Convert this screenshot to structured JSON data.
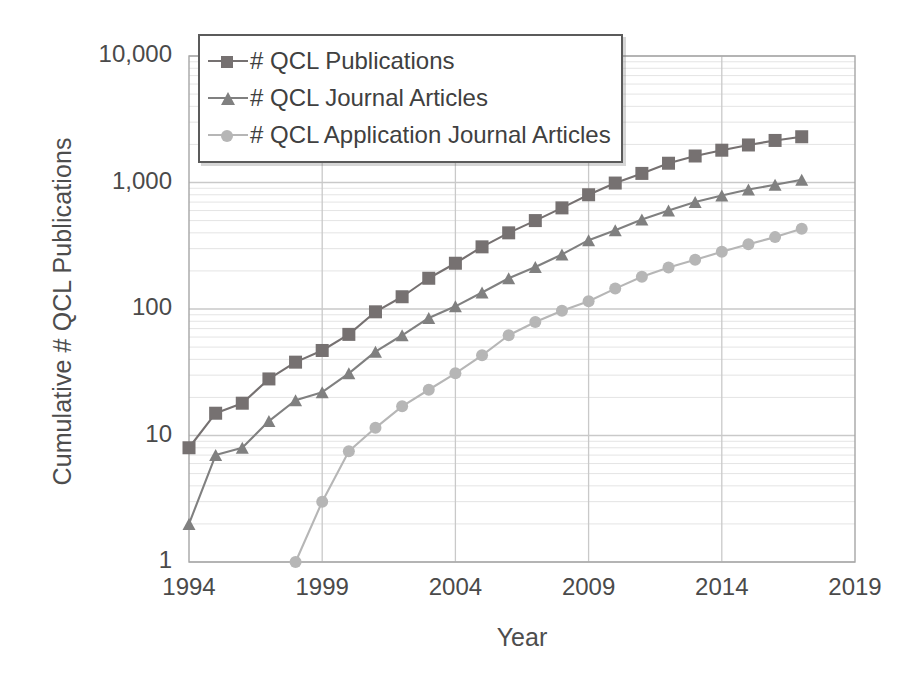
{
  "chart_data": {
    "type": "line",
    "title": "",
    "xlabel": "Year",
    "ylabel": "Cumulative # QCL Publications",
    "yscale": "log",
    "ylim": [
      1,
      10000
    ],
    "xlim": [
      1994,
      2019
    ],
    "grid": true,
    "legend_position": "top-left",
    "y_tick_labels": [
      "10,000",
      "1,000",
      "100",
      "10",
      "1"
    ],
    "y_tick_values": [
      10000,
      1000,
      100,
      10,
      1
    ],
    "x_tick_labels": [
      "1994",
      "1999",
      "2004",
      "2009",
      "2014",
      "2019"
    ],
    "x_tick_values": [
      1994,
      1999,
      2004,
      2009,
      2014,
      2019
    ],
    "series": [
      {
        "name": "# QCL Publications",
        "marker": "square",
        "color": "#767171",
        "x": [
          1994,
          1995,
          1996,
          1997,
          1998,
          1999,
          2000,
          2001,
          2002,
          2003,
          2004,
          2005,
          2006,
          2007,
          2008,
          2009,
          2010,
          2011,
          2012,
          2013,
          2014,
          2015,
          2016,
          2017
        ],
        "values": [
          8,
          15,
          18,
          28,
          38,
          47,
          63,
          95,
          125,
          175,
          230,
          310,
          400,
          500,
          630,
          800,
          990,
          1180,
          1420,
          1620,
          1800,
          1980,
          2150,
          2300
        ]
      },
      {
        "name": "# QCL Journal Articles",
        "marker": "triangle",
        "color": "#808080",
        "x": [
          1994,
          1995,
          1996,
          1997,
          1998,
          1999,
          2000,
          2001,
          2002,
          2003,
          2004,
          2005,
          2006,
          2007,
          2008,
          2009,
          2010,
          2011,
          2012,
          2013,
          2014,
          2015,
          2016,
          2017
        ],
        "values": [
          2,
          7,
          8,
          13,
          19,
          22,
          31,
          46,
          62,
          85,
          105,
          135,
          175,
          215,
          270,
          350,
          420,
          510,
          600,
          700,
          790,
          880,
          960,
          1050
        ]
      },
      {
        "name": "# QCL Application Journal Articles",
        "marker": "circle",
        "color": "#b6b6b6",
        "x": [
          1998,
          1999,
          2000,
          2001,
          2002,
          2003,
          2004,
          2005,
          2006,
          2007,
          2008,
          2009,
          2010,
          2011,
          2012,
          2013,
          2014,
          2015,
          2016,
          2017
        ],
        "values": [
          1,
          3,
          7.5,
          11.5,
          17,
          23,
          31,
          43,
          62,
          79,
          97,
          115,
          145,
          180,
          213,
          245,
          283,
          325,
          370,
          430
        ]
      }
    ]
  },
  "legend": {
    "items": [
      {
        "label": "# QCL Publications"
      },
      {
        "label": "# QCL Journal Articles"
      },
      {
        "label": "# QCL Application Journal Articles"
      }
    ]
  },
  "axes": {
    "y_title": "Cumulative # QCL Publications",
    "x_title": "Year"
  },
  "colors": {
    "series_1": "#767171",
    "series_2": "#808080",
    "series_3": "#b6b6b6",
    "axis": "#a6a6a6",
    "gridline_major": "#c9c9c9",
    "gridline_minor": "#e4e4e4",
    "text": "#4a4a4a",
    "legend_border": "#5b5b5b"
  }
}
